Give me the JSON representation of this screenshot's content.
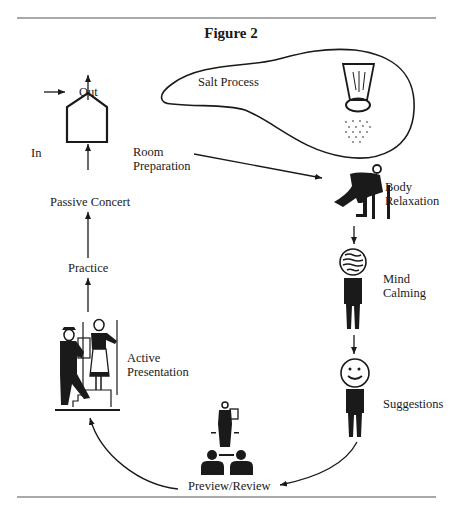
{
  "figure": {
    "title": "Figure 2",
    "colors": {
      "ink": "#1a1a1a",
      "rule": "#555555",
      "background": "#ffffff"
    }
  },
  "house": {
    "in_label": "In",
    "out_label": "Out"
  },
  "salt": {
    "label": "Salt Process"
  },
  "stages": {
    "room_preparation": {
      "line1": "Room",
      "line2": "Preparation"
    },
    "body_relaxation": {
      "line1": "Body",
      "line2": "Relaxation"
    },
    "mind_calming": {
      "line1": "Mind",
      "line2": "Calming"
    },
    "suggestions": {
      "label": "Suggestions"
    },
    "preview_review": {
      "label": "Preview/Review"
    },
    "active_presentation": {
      "line1": "Active",
      "line2": "Presentation"
    },
    "practice": {
      "label": "Practice"
    },
    "passive_concert": {
      "label": "Passive Concert"
    }
  },
  "icons": [
    "house-icon",
    "salt-shaker-icon",
    "seated-person-icon",
    "wavy-head-person-icon",
    "smiley-person-icon",
    "presenter-audience-icon",
    "stair-couple-icon"
  ]
}
